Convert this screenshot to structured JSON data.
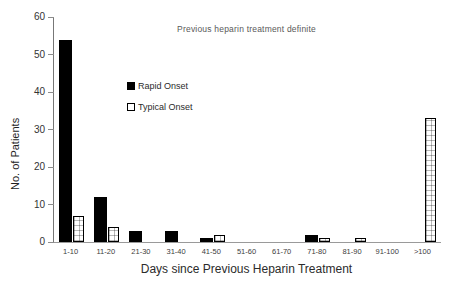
{
  "figure": {
    "title": "Previous heparin treatment definite",
    "x_axis_title": "Days since Previous Heparin Treatment",
    "y_axis_title": "No. of Patients"
  },
  "legend": {
    "items": [
      {
        "label": "Rapid Onset",
        "swatch": "solid-black-square"
      },
      {
        "label": "Typical Onset",
        "swatch": "open-white-square"
      }
    ],
    "position": "upper-left-inside"
  },
  "chart_data": {
    "type": "bar",
    "title": "Previous heparin treatment definite",
    "xlabel": "Days since Previous Heparin Treatment",
    "ylabel": "No. of Patients",
    "categories": [
      "1-10",
      "11-20",
      "21-30",
      "31-40",
      "41-50",
      "51-60",
      "61-70",
      "71-80",
      "81-90",
      "91-100",
      ">100"
    ],
    "series": [
      {
        "name": "Rapid Onset",
        "values": [
          54,
          12,
          3,
          3,
          1,
          0,
          0,
          2,
          0,
          0,
          0
        ]
      },
      {
        "name": "Typical Onset",
        "values": [
          7,
          4,
          0,
          0,
          2,
          0,
          0,
          1,
          1,
          0,
          33
        ]
      }
    ],
    "ylim": [
      0,
      60
    ],
    "yticks": [
      0,
      10,
      20,
      30,
      40,
      50,
      60
    ],
    "grid": false,
    "legend_position": "upper-left-inside"
  },
  "colors": {
    "bar_rapid": "#000000",
    "bar_typical_fill": "#ffffff",
    "bar_typical_pattern": "dotted-grid",
    "bar_border": "#000000",
    "axis_line": "#8c8c8c",
    "text": "#2b2b2b",
    "background": "#ffffff"
  }
}
